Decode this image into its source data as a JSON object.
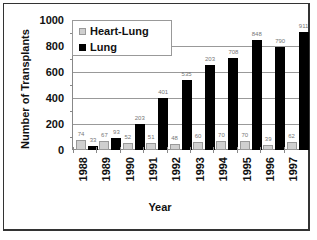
{
  "chart_data": {
    "type": "bar",
    "title": "",
    "xlabel": "Year",
    "ylabel": "Number of Transplants",
    "ylim": [
      0,
      1000
    ],
    "yticks": [
      "0",
      "200",
      "400",
      "600",
      "800",
      "1000"
    ],
    "grid": true,
    "legend_position": "upper-left",
    "categories": [
      "1988",
      "1989",
      "1990",
      "1991",
      "1992",
      "1993",
      "1994",
      "1995",
      "1996",
      "1997"
    ],
    "series": [
      {
        "name": "Heart-Lung",
        "color": "#cfcfcf",
        "values": [
          74,
          67,
          52,
          51,
          48,
          60,
          70,
          70,
          39,
          62
        ],
        "labels": [
          "74",
          "67",
          "52",
          "51",
          "48",
          "60",
          "70",
          "70",
          "39",
          "62"
        ]
      },
      {
        "name": "Lung",
        "color": "#000000",
        "values": [
          33,
          93,
          203,
          401,
          535,
          653,
          708,
          848,
          790,
          911
        ],
        "labels": [
          "33",
          "93",
          "203",
          "401",
          "535",
          "203",
          "708",
          "848",
          "790",
          "911"
        ]
      }
    ]
  },
  "legend": {
    "heart_lung": "Heart-Lung",
    "lung": "Lung"
  },
  "axis": {
    "xlabel": "Year",
    "ylabel": "Number of Transplants"
  }
}
